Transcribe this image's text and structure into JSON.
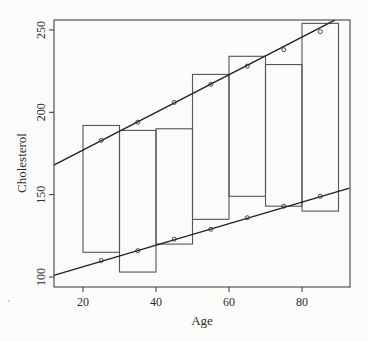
{
  "chart_data": {
    "type": "box-with-regression-lines",
    "title": "",
    "xlabel": "Age",
    "ylabel": "Cholesterol",
    "xlim": [
      12,
      92
    ],
    "ylim": [
      94,
      256
    ],
    "x_ticks": [
      20,
      40,
      60,
      80
    ],
    "y_ticks": [
      100,
      150,
      200,
      250
    ],
    "grid": false,
    "legend": null,
    "boxes": [
      {
        "x0": 20,
        "x1": 30,
        "y_low": 115,
        "y_high": 192
      },
      {
        "x0": 30,
        "x1": 40,
        "y_low": 103,
        "y_high": 189
      },
      {
        "x0": 40,
        "x1": 50,
        "y_low": 120,
        "y_high": 190
      },
      {
        "x0": 50,
        "x1": 60,
        "y_low": 135,
        "y_high": 223
      },
      {
        "x0": 60,
        "x1": 70,
        "y_low": 149,
        "y_high": 234
      },
      {
        "x0": 70,
        "x1": 80,
        "y_low": 143,
        "y_high": 229
      },
      {
        "x0": 80,
        "x1": 90,
        "y_low": 140,
        "y_high": 254
      }
    ],
    "series": [
      {
        "name": "upper line",
        "x": [
          25,
          35,
          45,
          55,
          65,
          75,
          85
        ],
        "values": [
          183,
          194,
          206,
          217,
          228,
          238,
          249
        ],
        "line": {
          "x_start": 12,
          "y_start": 168,
          "x_end": 89,
          "y_end": 256
        }
      },
      {
        "name": "lower line",
        "x": [
          25,
          35,
          45,
          55,
          65,
          75,
          85
        ],
        "values": [
          110,
          116,
          123,
          129,
          136,
          143,
          149
        ],
        "line": {
          "x_start": 12,
          "y_start": 101,
          "x_end": 93,
          "y_end": 154
        }
      }
    ]
  }
}
